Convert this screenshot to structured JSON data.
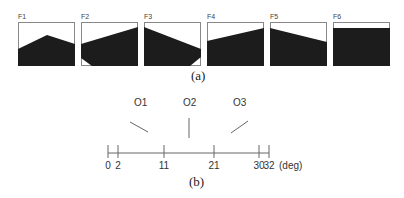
{
  "figure_a": {
    "caption": "(a)",
    "panels": [
      {
        "label": "F1",
        "shape": "peak",
        "fill_polygon": "0,27 29,13 57,22 57,44 0,44"
      },
      {
        "label": "F2",
        "shape": "rising-wedge",
        "fill_polygon": "0,22 57,5 57,44 11,44 0,36"
      },
      {
        "label": "F3",
        "shape": "falling-wedge",
        "fill_polygon": "0,5 57,27 57,35 46,44 0,44"
      },
      {
        "label": "F4",
        "shape": "rising-slope",
        "fill_polygon": "0,19 57,6 57,44 0,44"
      },
      {
        "label": "F5",
        "shape": "falling-slope",
        "fill_polygon": "0,6 57,20 57,44 0,44"
      },
      {
        "label": "F6",
        "shape": "flat",
        "fill_polygon": "0,6 57,6 57,44 0,44"
      }
    ],
    "fill_color": "#1c1c1c",
    "border_color": "#888888"
  },
  "figure_b": {
    "caption": "(b)",
    "unit": "(deg)",
    "ticks": [
      {
        "value": "0",
        "x": 108
      },
      {
        "value": "2",
        "x": 118
      },
      {
        "value": "11",
        "x": 164
      },
      {
        "value": "21",
        "x": 214
      },
      {
        "value": "30",
        "x": 259
      },
      {
        "value": "32",
        "x": 269
      }
    ],
    "orientations": [
      {
        "label": "O1",
        "x": 140
      },
      {
        "label": "O2",
        "x": 189
      },
      {
        "label": "O3",
        "x": 239
      }
    ]
  }
}
